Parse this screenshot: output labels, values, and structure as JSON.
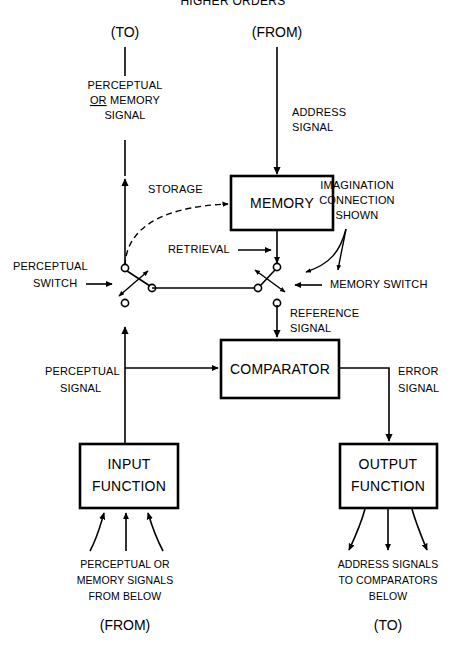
{
  "diagram": {
    "title": "HIGHER ORDERS",
    "top_labels": {
      "to": "(TO)",
      "from": "(FROM)"
    },
    "bottom_labels": {
      "from": "(FROM)",
      "to": "(TO)"
    },
    "boxes": {
      "memory": "MEMORY",
      "comparator": "COMPARATOR",
      "input_function_line1": "INPUT",
      "input_function_line2": "FUNCTION",
      "output_function_line1": "OUTPUT",
      "output_function_line2": "FUNCTION"
    },
    "signal_labels": {
      "perceptual_or_memory_l1": "PERCEPTUAL",
      "perceptual_or_memory_l2_or": "OR",
      "perceptual_or_memory_l2_rest": " MEMORY",
      "perceptual_or_memory_l3": "SIGNAL",
      "address_l1": "ADDRESS",
      "address_l2": "SIGNAL",
      "storage": "STORAGE",
      "retrieval": "RETRIEVAL",
      "imagination_l1": "IMAGINATION",
      "imagination_l2": "CONNECTION",
      "imagination_l3": "SHOWN",
      "perceptual_switch_l1": "PERCEPTUAL",
      "perceptual_switch_l2": "SWITCH",
      "memory_switch": "MEMORY  SWITCH",
      "reference_l1": "REFERENCE",
      "reference_l2": "SIGNAL",
      "perceptual_signal_l1": "PERCEPTUAL",
      "perceptual_signal_l2": "SIGNAL",
      "error_l1": "ERROR",
      "error_l2": "SIGNAL",
      "input_source_l1": "PERCEPTUAL OR",
      "input_source_l2": "MEMORY SIGNALS",
      "input_source_l3": "FROM BELOW",
      "output_dest_l1": "ADDRESS SIGNALS",
      "output_dest_l2": "TO COMPARATORS",
      "output_dest_l3": "BELOW"
    },
    "colors": {
      "ink": "#000000",
      "paper": "#ffffff"
    }
  }
}
